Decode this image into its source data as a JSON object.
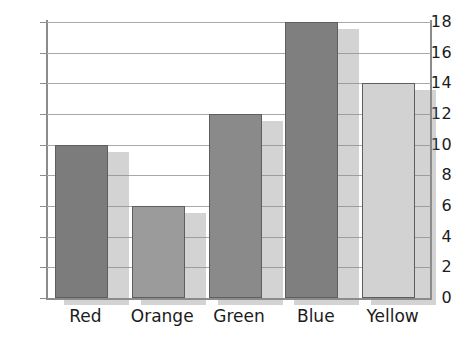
{
  "chart_data": {
    "type": "bar",
    "title": "",
    "subtitle": "",
    "xlabel": "",
    "ylabel": "",
    "categories": [
      "Red",
      "Orange",
      "Green",
      "Blue",
      "Yellow"
    ],
    "values": [
      10,
      6,
      12,
      18,
      14
    ],
    "series": [
      {
        "name": "",
        "values": [
          10,
          6,
          12,
          18,
          14
        ]
      }
    ],
    "ylim": [
      0,
      18
    ],
    "y_ticks": [
      0,
      2,
      4,
      6,
      8,
      10,
      12,
      14,
      16,
      18
    ],
    "y_tick_labels": [
      "0",
      "2",
      "4",
      "6",
      "8",
      "10",
      "12",
      "14",
      "16",
      "18"
    ],
    "grid": true,
    "grid_axis": "y",
    "legend": false,
    "legend_position": "none",
    "bar_colors": [
      "#7c7c7c",
      "#9b9b9b",
      "#8a8a8a",
      "#7f7f7f",
      "#d2d2d2"
    ],
    "bar_edge_color": "#5e5e5e",
    "shadow_color": "#8c8c8c",
    "gridline_color": "#a8a8a8",
    "axis_color": "#8c8c8c",
    "text_color": "#1b1b1b",
    "background_color": "#ffffff",
    "bars": [
      {
        "category": "Red",
        "value": 10,
        "color": "#7c7c7c"
      },
      {
        "category": "Orange",
        "value": 6,
        "color": "#9b9b9b"
      },
      {
        "category": "Green",
        "value": 12,
        "color": "#8a8a8a"
      },
      {
        "category": "Blue",
        "value": 18,
        "color": "#7f7f7f"
      },
      {
        "category": "Yellow",
        "value": 14,
        "color": "#d2d2d2"
      }
    ]
  }
}
